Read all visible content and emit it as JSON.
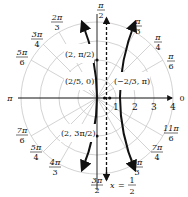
{
  "figure": {
    "type": "polar-graph",
    "equation": "r = 2/(1 + 4cos θ)",
    "center": [
      97,
      98
    ],
    "unit_px": 19,
    "grid_circles": [
      1,
      2,
      3,
      4
    ],
    "grid_color": "#c8c8c8",
    "curve_color": "#111111",
    "radial_ticks": [
      "1",
      "2",
      "3",
      "4"
    ],
    "angle_labels": [
      {
        "id": "pi-over-2",
        "num": "π",
        "den": "2",
        "x": 97,
        "y": 8
      },
      {
        "id": "pi-over-3",
        "num": "π",
        "den": "3",
        "x": 139,
        "y": 24
      },
      {
        "id": "pi-over-4",
        "num": "π",
        "den": "4",
        "x": 158,
        "y": 40
      },
      {
        "id": "pi-over-6",
        "num": "π",
        "den": "6",
        "x": 171,
        "y": 60
      },
      {
        "id": "zero",
        "text": "0",
        "x": 182,
        "y": 101
      },
      {
        "id": "2pi-over-3",
        "num": "2π",
        "den": "3",
        "x": 56,
        "y": 24
      },
      {
        "id": "3pi-over-4",
        "num": "3π",
        "den": "4",
        "x": 37,
        "y": 41
      },
      {
        "id": "5pi-over-6",
        "num": "5π",
        "den": "6",
        "x": 22,
        "y": 60
      },
      {
        "id": "pi",
        "text": "π",
        "x": 10,
        "y": 101
      },
      {
        "id": "7pi-over-6",
        "num": "7π",
        "den": "6",
        "x": 22,
        "y": 140
      },
      {
        "id": "5pi-over-4",
        "num": "5π",
        "den": "4",
        "x": 36,
        "y": 158
      },
      {
        "id": "4pi-over-3",
        "num": "4π",
        "den": "3",
        "x": 55,
        "y": 174
      },
      {
        "id": "3pi-over-2",
        "num": "3π",
        "den": "2",
        "x": 97,
        "y": 183
      },
      {
        "id": "5pi-over-3",
        "num": "5π",
        "den": "3",
        "x": 137,
        "y": 173
      },
      {
        "id": "7pi-over-4",
        "num": "7π",
        "den": "4",
        "x": 157,
        "y": 155
      },
      {
        "id": "11pi-over-6",
        "num": "11π",
        "den": "6",
        "x": 170,
        "y": 136
      }
    ],
    "point_labels": [
      {
        "id": "pt-2-pi-2",
        "text": "(2, π/2)"
      },
      {
        "id": "pt-2-5-0",
        "text": "(2/5, 0)"
      },
      {
        "id": "pt-neg2-3-pi",
        "text": "(−2/3, π)"
      },
      {
        "id": "pt-2-3pi-2",
        "text": "(2, 3π/2)"
      }
    ],
    "directrix": {
      "label_var": "x",
      "label_eq": "=",
      "num": "1",
      "den": "2",
      "x_value": 0.5
    }
  }
}
